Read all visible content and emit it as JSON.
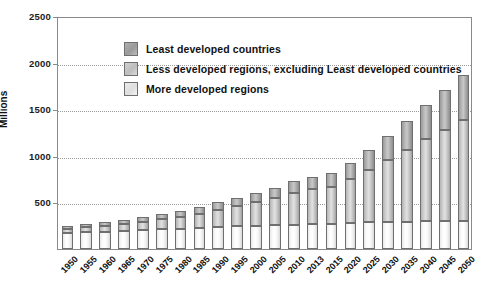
{
  "chart_data": {
    "type": "bar",
    "stacked": true,
    "title": "",
    "xlabel": "",
    "ylabel": "Millions",
    "ylim": [
      0,
      2500
    ],
    "yticks": [
      500,
      1000,
      1500,
      2000,
      2500
    ],
    "grid": true,
    "legend_position": "inside-top-left",
    "categories": [
      "1950",
      "1955",
      "1960",
      "1965",
      "1970",
      "1975",
      "1980",
      "1985",
      "1990",
      "1995",
      "2000",
      "2005",
      "2010",
      "2013",
      "2015",
      "2020",
      "2025",
      "2030",
      "2035",
      "2040",
      "2045",
      "2050"
    ],
    "series": [
      {
        "name": "More developed regions",
        "values": [
          170,
          180,
          185,
          195,
          205,
          215,
          220,
          230,
          240,
          245,
          250,
          255,
          260,
          265,
          270,
          280,
          285,
          290,
          295,
          300,
          300,
          300
        ]
      },
      {
        "name": "Less developed regions, excluding Least developed countries",
        "values": [
          45,
          55,
          65,
          75,
          90,
          105,
          125,
          150,
          180,
          215,
          250,
          290,
          340,
          375,
          400,
          470,
          560,
          660,
          770,
          880,
          980,
          1080
        ]
      },
      {
        "name": "Least developed countries",
        "values": [
          30,
          35,
          40,
          45,
          50,
          55,
          60,
          70,
          80,
          90,
          100,
          110,
          125,
          135,
          145,
          175,
          215,
          260,
          310,
          365,
          425,
          490
        ]
      }
    ],
    "totals": [
      245,
      270,
      290,
      315,
      345,
      375,
      405,
      450,
      500,
      550,
      600,
      655,
      725,
      775,
      815,
      925,
      1060,
      1210,
      1375,
      1545,
      1705,
      1870
    ]
  },
  "legend": {
    "items": [
      {
        "label": "Least developed countries",
        "swatch": "least"
      },
      {
        "label": "Less developed regions, excluding Least developed countries",
        "swatch": "less"
      },
      {
        "label": "More developed regions",
        "swatch": "more"
      }
    ]
  },
  "colors": {
    "least": "#9a9a9a",
    "less": "#c2c2c2",
    "more": "#f0f0f0",
    "axis": "#8a8a8a",
    "grid": "#9a9a9a",
    "text": "#111111"
  }
}
